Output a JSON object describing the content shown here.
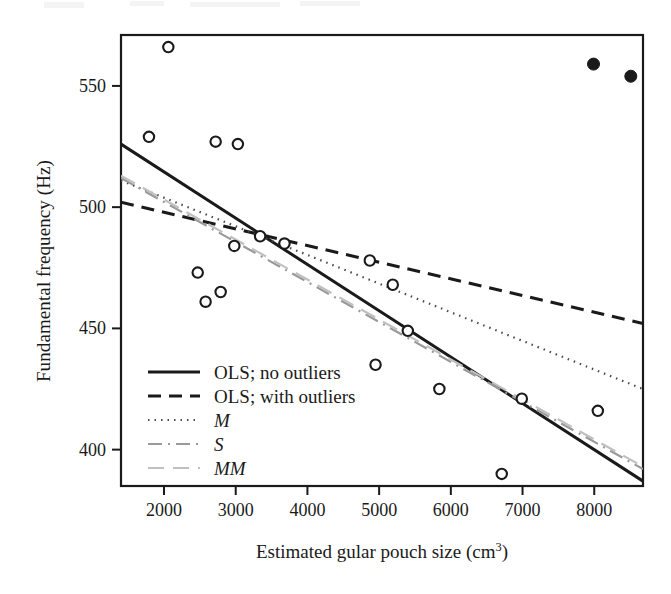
{
  "figure": {
    "background": "#ffffff",
    "ink_color": "#1a1a1a",
    "gray_color": "#9a9a9a",
    "light_gray_color": "#c8c8c8"
  },
  "axes": {
    "y_label_text": "Fundamental frequency (Hz)",
    "x_label_prefix": "Estimated gular pouch size (cm",
    "x_label_superscript": "3",
    "x_label_suffix": ")",
    "x_ticks": [
      "2000",
      "3000",
      "4000",
      "5000",
      "6000",
      "7000",
      "8000"
    ],
    "y_ticks": [
      "550",
      "500",
      "450",
      "400"
    ]
  },
  "legend": {
    "items": [
      {
        "label": "OLS; no outliers",
        "style": "solid",
        "italic": false,
        "color": "#1a1a1a"
      },
      {
        "label": "OLS; with outliers",
        "style": "dashed",
        "italic": false,
        "color": "#1a1a1a"
      },
      {
        "label": "M",
        "style": "dotted",
        "italic": true,
        "color": "#4a4a4a"
      },
      {
        "label": "S",
        "style": "dashdot",
        "italic": true,
        "color": "#9a9a9a"
      },
      {
        "label": "MM",
        "style": "longdash",
        "italic": true,
        "color": "#c0c0c0"
      }
    ]
  },
  "chart_data": {
    "type": "scatter",
    "title": "",
    "xlabel": "Estimated gular pouch size (cm3)",
    "ylabel": "Fundamental frequency (Hz)",
    "xlim": [
      1400,
      8680
    ],
    "ylim": [
      385,
      571
    ],
    "grid": false,
    "legend_position": "lower-left-inside",
    "series": [
      {
        "name": "non-outlier observations",
        "marker": "open-circle",
        "points": [
          {
            "x": 2060,
            "y": 566
          },
          {
            "x": 1790,
            "y": 529
          },
          {
            "x": 2720,
            "y": 527
          },
          {
            "x": 3030,
            "y": 526
          },
          {
            "x": 2980,
            "y": 484
          },
          {
            "x": 3340,
            "y": 488
          },
          {
            "x": 3680,
            "y": 485
          },
          {
            "x": 2470,
            "y": 473
          },
          {
            "x": 2580,
            "y": 461
          },
          {
            "x": 2790,
            "y": 465
          },
          {
            "x": 4870,
            "y": 478
          },
          {
            "x": 5190,
            "y": 468
          },
          {
            "x": 4950,
            "y": 435
          },
          {
            "x": 5400,
            "y": 449
          },
          {
            "x": 5840,
            "y": 425
          },
          {
            "x": 6990,
            "y": 421
          },
          {
            "x": 8050,
            "y": 416
          },
          {
            "x": 6710,
            "y": 390
          }
        ]
      },
      {
        "name": "outliers",
        "marker": "filled-circle",
        "points": [
          {
            "x": 7990,
            "y": 559
          },
          {
            "x": 8510,
            "y": 554
          }
        ]
      }
    ],
    "fits": [
      {
        "name": "OLS; no outliers",
        "style": "solid",
        "x1": 1400,
        "y1": 526,
        "x2": 8680,
        "y2": 387
      },
      {
        "name": "OLS; with outliers",
        "style": "dashed",
        "x1": 1400,
        "y1": 502,
        "x2": 8680,
        "y2": 452
      },
      {
        "name": "M",
        "style": "dotted",
        "x1": 1400,
        "y1": 511,
        "x2": 8680,
        "y2": 425
      },
      {
        "name": "S",
        "style": "dashdot",
        "x1": 1400,
        "y1": 512,
        "x2": 8680,
        "y2": 392
      },
      {
        "name": "MM",
        "style": "longdash",
        "x1": 1400,
        "y1": 513,
        "x2": 8680,
        "y2": 393
      }
    ]
  }
}
